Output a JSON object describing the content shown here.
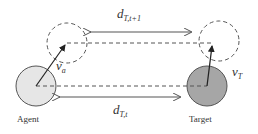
{
  "diagram": {
    "agent_label": "Agent",
    "target_label": "Target",
    "top_distance": {
      "symbol": "d",
      "subscript": "T,t+1"
    },
    "bottom_distance": {
      "symbol": "d",
      "subscript": "T,t"
    },
    "agent_velocity": {
      "symbol": "v",
      "subscript": "a"
    },
    "target_velocity": {
      "symbol": "v",
      "subscript": "T"
    },
    "colors": {
      "agent_fill": "#e6e6e6",
      "target_fill": "#a6a6a6",
      "stroke": "#555555"
    }
  }
}
